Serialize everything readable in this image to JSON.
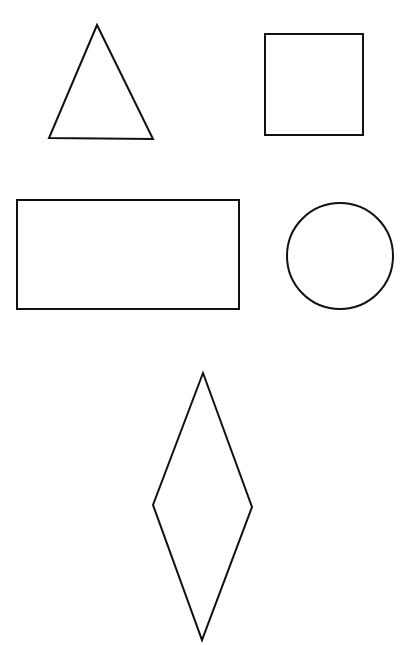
{
  "diagram": {
    "background": "#ffffff",
    "stroke_color": "#111111",
    "stroke_width": 2,
    "shapes": [
      {
        "name": "triangle",
        "type": "polygon",
        "points": "97,25 49,138 153,139"
      },
      {
        "name": "square",
        "type": "rect",
        "x": 265,
        "y": 34,
        "width": 98,
        "height": 101
      },
      {
        "name": "rectangle",
        "type": "rect",
        "x": 17,
        "y": 200,
        "width": 222,
        "height": 109
      },
      {
        "name": "circle",
        "type": "circle",
        "cx": 340,
        "cy": 256,
        "r": 53
      },
      {
        "name": "diamond",
        "type": "polygon",
        "points": "203,373 252,507 202,640 153,505"
      }
    ]
  }
}
